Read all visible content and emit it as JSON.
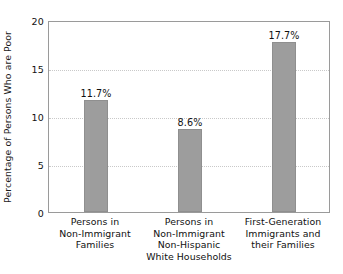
{
  "chart_data": {
    "type": "bar",
    "title": "",
    "subtitle": "",
    "xlabel": "",
    "ylabel": "Percentage of Persons Who are Poor",
    "ylim": [
      0,
      20
    ],
    "yticks": [
      "0",
      "5",
      "10",
      "15",
      "20"
    ],
    "ytick_values": [
      0,
      5,
      10,
      15,
      20
    ],
    "grid": "horizontal-dotted",
    "legend": "none",
    "bar_color": "#9d9d9d",
    "categories": [
      "Persons in Non-Immigrant Families",
      "Persons in Non-Immigrant Non-Hispanic White Households",
      "First-Generation Immigrants and their Families"
    ],
    "category_lines": [
      [
        "Persons in",
        "Non-Immigrant",
        "Families"
      ],
      [
        "Persons in",
        "Non-Immigrant",
        "Non-Hispanic",
        "White Households"
      ],
      [
        "First-Generation",
        "Immigrants and",
        "their Families"
      ]
    ],
    "values": [
      11.7,
      8.6,
      17.7
    ],
    "value_labels": [
      "11.7%",
      "8.6%",
      "17.7%"
    ]
  }
}
